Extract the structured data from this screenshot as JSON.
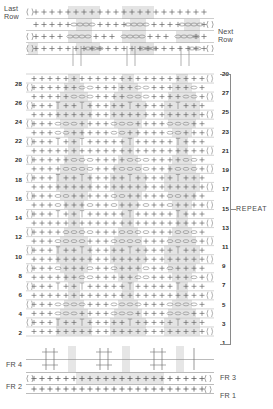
{
  "chart": {
    "type": "stitch-diagram",
    "labels": {
      "last_row": "Last\nRow",
      "next_row": "Next\nRow",
      "repeat": "REPEAT"
    },
    "foundation_rows": {
      "left": [
        "FR 4",
        "FR 2"
      ],
      "right": [
        "FR 3",
        "FR 1"
      ]
    },
    "row_numbers": {
      "left_even": [
        28,
        26,
        24,
        22,
        20,
        18,
        16,
        14,
        12,
        10,
        8,
        6,
        4,
        2
      ],
      "right_odd": [
        29,
        27,
        25,
        23,
        21,
        19,
        17,
        15,
        13,
        11,
        9,
        7,
        5,
        3,
        1
      ]
    },
    "row_count": 29,
    "stitch_columns": 21,
    "legend_symbols": [
      {
        "name": "single-crochet",
        "glyph": "+"
      },
      {
        "name": "chain-cluster",
        "glyph": "oooo"
      },
      {
        "name": "post-stitch",
        "glyph": "|"
      },
      {
        "name": "turning-chain",
        "glyph": "()"
      }
    ],
    "colors": {
      "ink": "#4a4a4a",
      "grid": "#9a9a9a",
      "shade": "#e2e2e2",
      "bracket": "#8a8a8a"
    }
  },
  "chart_data": {
    "type": "table",
    "xlabel": "stitch column",
    "ylabel": "row",
    "categories": [
      "1",
      "2",
      "3",
      "4",
      "5",
      "6",
      "7",
      "8",
      "9",
      "10",
      "11",
      "12",
      "13",
      "14",
      "15",
      "16",
      "17",
      "18",
      "19",
      "20",
      "21",
      "22",
      "23",
      "24",
      "25",
      "26",
      "27",
      "28",
      "29"
    ],
    "values": [
      21,
      21,
      21,
      21,
      21,
      21,
      21,
      21,
      21,
      21,
      21,
      21,
      21,
      21,
      21,
      21,
      21,
      21,
      21,
      21,
      21,
      21,
      21,
      21,
      21,
      21,
      21,
      21,
      21
    ],
    "series": [
      {
        "name": "stitches per row",
        "values": [
          21,
          21,
          21,
          21,
          21,
          21,
          21,
          21,
          21,
          21,
          21,
          21,
          21,
          21,
          21,
          21,
          21,
          21,
          21,
          21,
          21,
          21,
          21,
          21,
          21,
          21,
          21,
          21,
          21
        ]
      }
    ]
  }
}
